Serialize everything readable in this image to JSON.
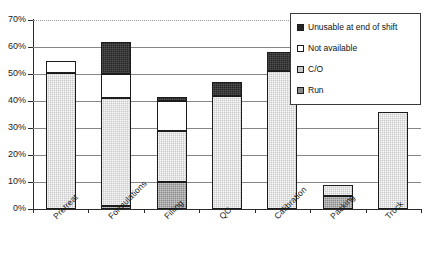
{
  "chart_data": {
    "type": "bar",
    "subtype": "stacked-bar",
    "title": "",
    "xlabel": "",
    "ylabel": "",
    "ylim": [
      0,
      70
    ],
    "y_tick_labels": [
      "0%",
      "10%",
      "20%",
      "30%",
      "40%",
      "50%",
      "60%",
      "70%"
    ],
    "y_tick_values": [
      0,
      10,
      20,
      30,
      40,
      50,
      60,
      70
    ],
    "grid": true,
    "legend_position": "top-right",
    "categories": [
      "Pretreat",
      "Formulations",
      "Filling",
      "QC",
      "Calibration",
      "Packing",
      "Truck"
    ],
    "series": [
      {
        "name": "Run",
        "color": "#8a8a8a",
        "values": [
          0,
          1,
          10,
          0,
          0,
          5,
          0
        ]
      },
      {
        "name": "C/O",
        "color": "#c8c8c8",
        "values": [
          50.5,
          40,
          19,
          42,
          51,
          4,
          36
        ]
      },
      {
        "name": "Not available",
        "color": "#ffffff",
        "values": [
          4.5,
          9,
          11,
          0,
          0,
          0,
          0
        ]
      },
      {
        "name": "Unusable at end of shift",
        "color": "#262626",
        "values": [
          0,
          12,
          1.5,
          5,
          7,
          0,
          0
        ]
      }
    ],
    "totals": [
      55,
      62,
      41.5,
      47,
      58,
      9,
      36
    ]
  },
  "legend": {
    "entries": [
      {
        "label": "Unusable at end of shift",
        "swatch": "#262626"
      },
      {
        "label": "Not available",
        "swatch": "#ffffff"
      },
      {
        "label": "C/O",
        "swatch": "#c8c8c8"
      },
      {
        "label": "Run",
        "swatch": "#8a8a8a"
      }
    ]
  }
}
